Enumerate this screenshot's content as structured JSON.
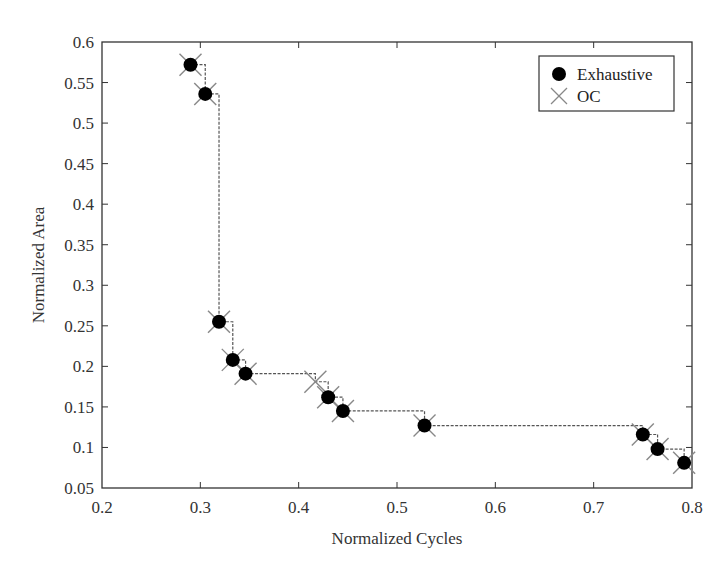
{
  "chart_data": {
    "type": "scatter",
    "title": "",
    "xlabel": "Normalized Cycles",
    "ylabel": "Normalized Area",
    "xlim": [
      0.2,
      0.8
    ],
    "ylim": [
      0.05,
      0.6
    ],
    "xticks": [
      0.2,
      0.3,
      0.4,
      0.5,
      0.6,
      0.7,
      0.8
    ],
    "xtick_labels": [
      "0.2",
      "0.3",
      "0.4",
      "0.5",
      "0.6",
      "0.7",
      "0.8"
    ],
    "yticks": [
      0.05,
      0.1,
      0.15,
      0.2,
      0.25,
      0.3,
      0.35,
      0.4,
      0.45,
      0.5,
      0.55,
      0.6
    ],
    "ytick_labels": [
      "0.05",
      "0.1",
      "0.15",
      "0.2",
      "0.25",
      "0.3",
      "0.35",
      "0.4",
      "0.45",
      "0.5",
      "0.55",
      "0.6"
    ],
    "grid": false,
    "legend_position": "upper right",
    "legend": [
      {
        "label": "Exhaustive",
        "marker": "filled-circle",
        "color": "#000000"
      },
      {
        "label": "OC",
        "marker": "x-cross",
        "color": "#888888"
      }
    ],
    "series": [
      {
        "name": "Exhaustive",
        "marker": "filled-circle",
        "color": "#000000",
        "x": [
          0.29,
          0.305,
          0.319,
          0.333,
          0.346,
          0.43,
          0.445,
          0.528,
          0.75,
          0.765,
          0.792
        ],
        "y": [
          0.572,
          0.536,
          0.255,
          0.208,
          0.191,
          0.162,
          0.145,
          0.127,
          0.116,
          0.098,
          0.081
        ]
      },
      {
        "name": "OC",
        "marker": "x-cross",
        "color": "#888888",
        "step_line": true,
        "x": [
          0.29,
          0.305,
          0.319,
          0.333,
          0.346,
          0.417,
          0.43,
          0.445,
          0.528,
          0.75,
          0.765,
          0.792
        ],
        "y": [
          0.572,
          0.536,
          0.255,
          0.208,
          0.191,
          0.181,
          0.162,
          0.145,
          0.127,
          0.116,
          0.098,
          0.081
        ]
      }
    ]
  }
}
